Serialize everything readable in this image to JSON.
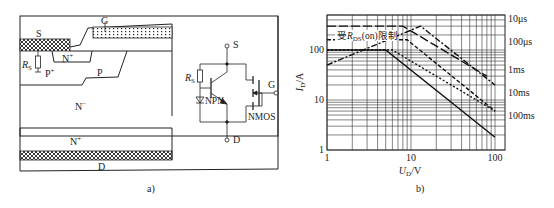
{
  "figure_a": {
    "caption": "a)",
    "structure_labels": {
      "source": "S",
      "gate": "G",
      "n_plus_top": "N",
      "n_plus_top_sup": "+",
      "rs": "R",
      "rs_sub": "S",
      "p_plus": "P",
      "p_plus_sup": "+",
      "p": "P",
      "n_minus": "N",
      "n_minus_sup": "−",
      "n_plus_bottom": "N",
      "n_plus_bottom_sup": "+",
      "drain": "D"
    },
    "circuit_labels": {
      "source": "S",
      "gate": "G",
      "drain": "D",
      "rs": "R",
      "rs_sub": "S",
      "npn": "NPN",
      "nmos": "NMOS"
    }
  },
  "figure_b": {
    "caption": "b)",
    "annotation": "受R",
    "annotation_sub": "DS",
    "annotation_tail": "(on)限制"
  },
  "chart_data": {
    "type": "line",
    "title": "",
    "xlabel": "U_D/V",
    "ylabel": "I_D/A",
    "xscale": "log",
    "yscale": "log",
    "xlim": [
      1,
      120
    ],
    "ylim": [
      1,
      500
    ],
    "x_ticks": [
      "1",
      "10",
      "100"
    ],
    "y_ticks": [
      "1",
      "10",
      "100"
    ],
    "grid": true,
    "legend_position": "right",
    "rds_on_limit_label": "受RDS(on)限制",
    "series": [
      {
        "name": "10μs",
        "style": "long-dash",
        "points": [
          [
            1,
            300
          ],
          [
            8,
            300
          ],
          [
            80,
            30
          ]
        ]
      },
      {
        "name": "100μs",
        "style": "dash-dot",
        "points": [
          [
            1,
            50
          ],
          [
            13,
            300
          ],
          [
            100,
            20
          ]
        ]
      },
      {
        "name": "1ms",
        "style": "dashed",
        "points": [
          [
            1,
            160
          ],
          [
            9,
            160
          ],
          [
            100,
            6
          ]
        ]
      },
      {
        "name": "10ms",
        "style": "short-dash",
        "points": [
          [
            1,
            100
          ],
          [
            6,
            100
          ],
          [
            100,
            6
          ]
        ]
      },
      {
        "name": "100ms",
        "style": "solid",
        "points": [
          [
            1,
            100
          ],
          [
            5,
            100
          ],
          [
            100,
            1.8
          ]
        ]
      }
    ]
  }
}
